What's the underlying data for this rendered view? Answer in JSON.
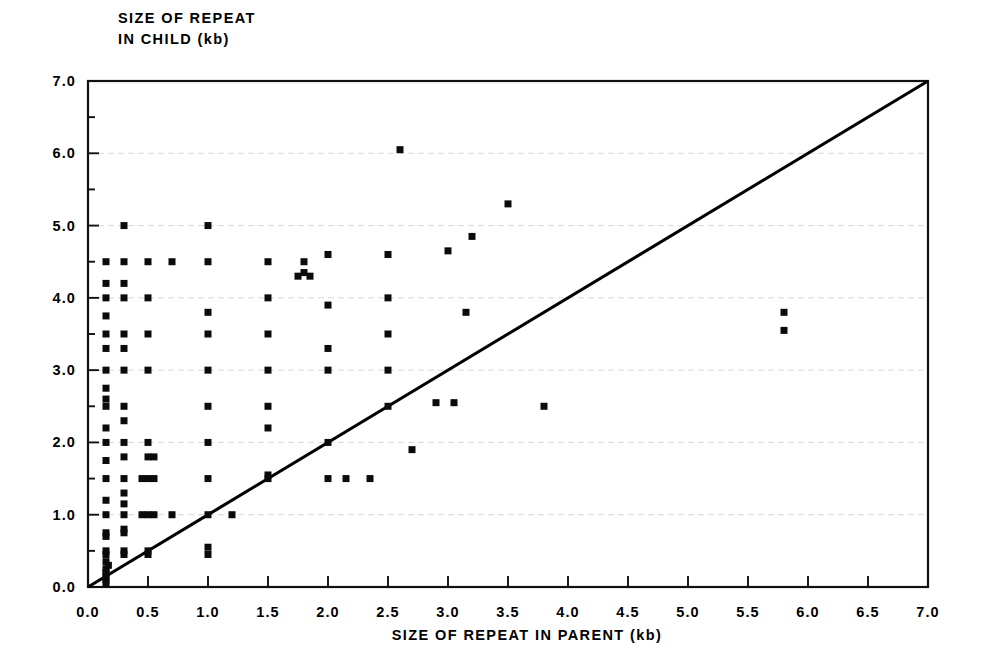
{
  "figure": {
    "background": "#ffffff",
    "ink_color": "#000000",
    "grid_color": "#c9c9c9"
  },
  "axes": {
    "y_title_line1": "SIZE OF REPEAT",
    "y_title_line2": "IN CHILD (kb)",
    "x_title": "SIZE OF REPEAT IN PARENT (kb)",
    "x_tick_labels": [
      "0.0",
      "0.5",
      "1.0",
      "1.5",
      "2.0",
      "2.5",
      "3.0",
      "3.5",
      "4.0",
      "4.5",
      "5.0",
      "5.5",
      "6.0",
      "6.5",
      "7.0"
    ],
    "y_tick_labels": [
      "0.0",
      "1.0",
      "2.0",
      "3.0",
      "4.0",
      "5.0",
      "6.0",
      "7.0"
    ]
  },
  "chart_data": {
    "type": "scatter",
    "title": "",
    "xlabel": "SIZE OF REPEAT IN PARENT (kb)",
    "ylabel": "SIZE OF REPEAT IN CHILD (kb)",
    "xlim": [
      0.0,
      7.0
    ],
    "ylim": [
      0.0,
      7.0
    ],
    "xticks": [
      0.0,
      0.5,
      1.0,
      1.5,
      2.0,
      2.5,
      3.0,
      3.5,
      4.0,
      4.5,
      5.0,
      5.5,
      6.0,
      6.5,
      7.0
    ],
    "yticks": [
      0.0,
      1.0,
      2.0,
      3.0,
      4.0,
      5.0,
      6.0,
      7.0
    ],
    "x_minor_ticks": [],
    "y_minor_ticks": [
      0.5,
      1.5,
      2.5,
      3.5,
      4.5,
      5.5,
      6.5
    ],
    "grid": "horizontal-major-dashed",
    "legend": "none",
    "marker": "filled-square",
    "marker_size_px": 7,
    "reference_line": {
      "name": "identity-line",
      "label": "y = x",
      "from": [
        0.0,
        0.0
      ],
      "to": [
        7.0,
        7.0
      ],
      "color": "#000000"
    },
    "points": [
      [
        0.15,
        0.1
      ],
      [
        0.15,
        0.15
      ],
      [
        0.15,
        0.2
      ],
      [
        0.15,
        0.25
      ],
      [
        0.17,
        0.3
      ],
      [
        0.15,
        0.35
      ],
      [
        0.15,
        0.45
      ],
      [
        0.15,
        0.5
      ],
      [
        0.15,
        0.7
      ],
      [
        0.15,
        0.75
      ],
      [
        0.15,
        1.0
      ],
      [
        0.15,
        1.2
      ],
      [
        0.15,
        1.5
      ],
      [
        0.15,
        1.75
      ],
      [
        0.15,
        2.0
      ],
      [
        0.15,
        2.2
      ],
      [
        0.15,
        2.5
      ],
      [
        0.15,
        2.6
      ],
      [
        0.15,
        2.75
      ],
      [
        0.15,
        3.0
      ],
      [
        0.15,
        3.3
      ],
      [
        0.15,
        3.5
      ],
      [
        0.15,
        3.75
      ],
      [
        0.15,
        4.0
      ],
      [
        0.15,
        4.2
      ],
      [
        0.15,
        4.5
      ],
      [
        0.15,
        0.05
      ],
      [
        0.3,
        0.5
      ],
      [
        0.3,
        0.75
      ],
      [
        0.3,
        0.8
      ],
      [
        0.3,
        1.0
      ],
      [
        0.3,
        1.15
      ],
      [
        0.3,
        1.3
      ],
      [
        0.3,
        1.5
      ],
      [
        0.3,
        1.8
      ],
      [
        0.3,
        2.0
      ],
      [
        0.3,
        2.3
      ],
      [
        0.3,
        2.5
      ],
      [
        0.3,
        3.0
      ],
      [
        0.3,
        3.3
      ],
      [
        0.3,
        3.5
      ],
      [
        0.3,
        4.0
      ],
      [
        0.3,
        4.2
      ],
      [
        0.3,
        4.5
      ],
      [
        0.3,
        5.0
      ],
      [
        0.3,
        0.45
      ],
      [
        0.5,
        0.45
      ],
      [
        0.5,
        0.5
      ],
      [
        0.5,
        1.0
      ],
      [
        0.5,
        1.5
      ],
      [
        0.5,
        1.8
      ],
      [
        0.5,
        2.0
      ],
      [
        0.5,
        3.0
      ],
      [
        0.5,
        3.5
      ],
      [
        0.5,
        4.0
      ],
      [
        0.5,
        4.5
      ],
      [
        0.45,
        1.0
      ],
      [
        0.55,
        1.0
      ],
      [
        0.45,
        1.5
      ],
      [
        0.55,
        1.5
      ],
      [
        0.55,
        1.8
      ],
      [
        0.7,
        1.0
      ],
      [
        0.7,
        4.5
      ],
      [
        1.0,
        0.45
      ],
      [
        1.0,
        0.55
      ],
      [
        1.0,
        1.0
      ],
      [
        1.0,
        1.5
      ],
      [
        1.0,
        2.0
      ],
      [
        1.0,
        2.5
      ],
      [
        1.0,
        3.0
      ],
      [
        1.0,
        3.5
      ],
      [
        1.0,
        3.8
      ],
      [
        1.0,
        4.5
      ],
      [
        1.0,
        5.0
      ],
      [
        1.2,
        1.0
      ],
      [
        1.5,
        1.5
      ],
      [
        1.5,
        1.55
      ],
      [
        1.5,
        2.2
      ],
      [
        1.5,
        2.5
      ],
      [
        1.5,
        3.0
      ],
      [
        1.5,
        3.5
      ],
      [
        1.5,
        4.0
      ],
      [
        1.5,
        4.5
      ],
      [
        1.75,
        4.3
      ],
      [
        1.8,
        4.35
      ],
      [
        1.85,
        4.3
      ],
      [
        1.8,
        4.5
      ],
      [
        2.0,
        1.5
      ],
      [
        2.0,
        2.0
      ],
      [
        2.0,
        3.0
      ],
      [
        2.0,
        3.3
      ],
      [
        2.0,
        3.9
      ],
      [
        2.0,
        4.6
      ],
      [
        2.15,
        1.5
      ],
      [
        2.35,
        1.5
      ],
      [
        2.5,
        2.5
      ],
      [
        2.5,
        3.0
      ],
      [
        2.5,
        3.5
      ],
      [
        2.5,
        4.0
      ],
      [
        2.5,
        4.6
      ],
      [
        2.6,
        6.05
      ],
      [
        2.7,
        1.9
      ],
      [
        2.9,
        2.55
      ],
      [
        3.0,
        4.65
      ],
      [
        3.15,
        3.8
      ],
      [
        3.2,
        4.85
      ],
      [
        3.05,
        2.55
      ],
      [
        3.5,
        5.3
      ],
      [
        3.8,
        2.5
      ],
      [
        5.8,
        3.8
      ],
      [
        5.8,
        3.55
      ]
    ]
  }
}
